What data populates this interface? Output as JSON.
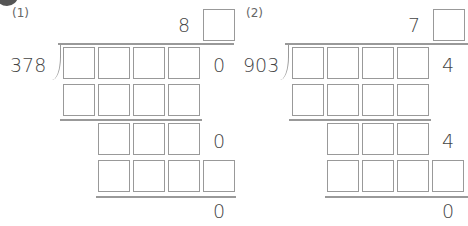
{
  "problems": [
    {
      "label": "(1)",
      "divisor": "378",
      "quotient_known_digit": "8",
      "dividend_last_digit": "0",
      "step2_last_digit": "0",
      "remainder": "0"
    },
    {
      "label": "(2)",
      "divisor": "903",
      "quotient_known_digit": "7",
      "dividend_last_digit": "4",
      "step2_last_digit": "4",
      "remainder": "0"
    }
  ]
}
